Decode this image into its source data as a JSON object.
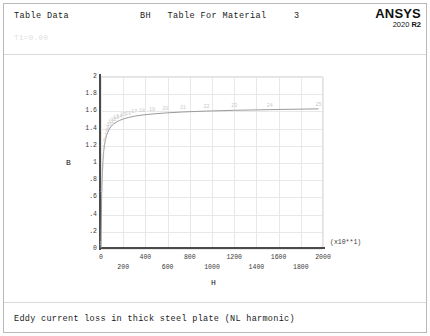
{
  "window": {
    "header_left": "Table Data",
    "header_title": "BH   Table For Material     3",
    "header_sub": "T1=0.00",
    "footer_caption": "Eddy current loss in thick steel plate (NL harmonic)"
  },
  "logo": {
    "brand": "ANSYS",
    "version_year": "2020",
    "version_release": "R2"
  },
  "chart_data": {
    "type": "line",
    "title": "BH   Table For Material     3",
    "xlabel": "H",
    "ylabel": "B",
    "x_multiplier": "(x10**1)",
    "xlim": [
      0,
      2000
    ],
    "ylim": [
      0,
      2
    ],
    "grid": true,
    "legend": "none",
    "xticks": [
      0,
      200,
      400,
      600,
      800,
      1000,
      1200,
      1400,
      1600,
      1800,
      2000
    ],
    "xtick_labels": [
      "0",
      "200",
      "400",
      "600",
      "800",
      "1000",
      "1200",
      "1400",
      "1600",
      "1800",
      "2000"
    ],
    "yticks": [
      0,
      0.2,
      0.4,
      0.6,
      0.8,
      1,
      1.2,
      1.4,
      1.6,
      1.8,
      2
    ],
    "ytick_labels": [
      "0",
      ".2",
      ".4",
      ".6",
      ".8",
      "1",
      "1.2",
      "1.4",
      "1.6",
      "1.8",
      "2"
    ],
    "series": [
      {
        "name": "BH curve",
        "color": "#9a9a9a",
        "point_labels": [
          "1",
          "2",
          "3",
          "4",
          "5",
          "6",
          "7",
          "8",
          "9",
          "10",
          "11",
          "12",
          "13",
          "14",
          "15",
          "16",
          "17",
          "18",
          "19",
          "20",
          "21",
          "22",
          "23",
          "24",
          "25"
        ],
        "x": [
          0,
          6,
          12,
          18,
          24,
          32,
          40,
          50,
          62,
          76,
          92,
          112,
          136,
          165,
          200,
          245,
          300,
          370,
          460,
          580,
          740,
          950,
          1200,
          1520,
          1960
        ],
        "y": [
          0.0,
          0.62,
          0.88,
          1.02,
          1.12,
          1.2,
          1.26,
          1.31,
          1.35,
          1.385,
          1.415,
          1.44,
          1.462,
          1.482,
          1.5,
          1.517,
          1.532,
          1.546,
          1.558,
          1.57,
          1.582,
          1.592,
          1.601,
          1.609,
          1.618
        ]
      }
    ]
  }
}
